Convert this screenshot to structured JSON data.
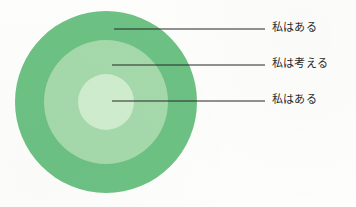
{
  "diagram": {
    "type": "concentric-circles",
    "background_color": "#fdfdfc",
    "center": {
      "x": 106,
      "y": 102
    },
    "rings": [
      {
        "name": "outer-ring",
        "radius": 91,
        "color": "#6cc183",
        "label": "私はある",
        "leader_line": {
          "start_x": 114,
          "end_x": 265,
          "y": 29
        }
      },
      {
        "name": "middle-ring",
        "radius": 62,
        "color": "#a5d9ab",
        "label": "私は考える",
        "leader_line": {
          "start_x": 112,
          "end_x": 265,
          "y": 65
        }
      },
      {
        "name": "inner-circle",
        "radius": 28,
        "color": "#cfeccd",
        "label": "私はある",
        "leader_line": {
          "start_x": 112,
          "end_x": 265,
          "y": 101
        }
      }
    ],
    "leader_line_color": "#262626",
    "label_text_color": "#2b2b2b"
  }
}
